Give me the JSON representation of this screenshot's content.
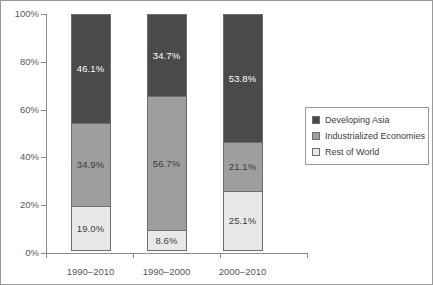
{
  "chart_data": {
    "type": "bar",
    "stacked": true,
    "title": "",
    "subtitle": "",
    "xlabel": "",
    "ylabel": "",
    "categories": [
      "1990–2010",
      "1990–2000",
      "2000–2010"
    ],
    "series": [
      {
        "name": "Developing Asia",
        "color": "#4a4a4a",
        "values": [
          46.1,
          34.7,
          53.8
        ],
        "labels": [
          "46.1%",
          "34.7%",
          "53.8%"
        ],
        "label_color": "on-dark"
      },
      {
        "name": "Industrialized Economies",
        "color": "#9e9e9e",
        "values": [
          34.9,
          56.7,
          21.1
        ],
        "labels": [
          "34.9%",
          "56.7%",
          "21.1%"
        ],
        "label_color": "on-light"
      },
      {
        "name": "Rest of World",
        "color": "#e8e8e8",
        "values": [
          19.0,
          8.6,
          25.1
        ],
        "labels": [
          "19.0%",
          "8.6%",
          "25.1%"
        ],
        "label_color": "on-light"
      }
    ],
    "ylim": [
      0,
      100
    ],
    "yticks": [
      0,
      20,
      40,
      60,
      80,
      100
    ],
    "ytick_labels": [
      "0%",
      "20%",
      "40%",
      "60%",
      "80%",
      "100%"
    ],
    "grid": false,
    "legend_position": "right",
    "legend_entries": [
      "Developing Asia",
      "Industrialized Economies",
      "Rest of World"
    ]
  },
  "axes": {
    "y": {
      "ticks": [
        {
          "value": 100,
          "label": "100%"
        },
        {
          "value": 80,
          "label": "80%"
        },
        {
          "value": 60,
          "label": "60%"
        },
        {
          "value": 40,
          "label": "40%"
        },
        {
          "value": 20,
          "label": "20%"
        },
        {
          "value": 0,
          "label": "0%"
        }
      ]
    },
    "x": {
      "ticks": [
        {
          "label": "1990–2010"
        },
        {
          "label": "1990–2000"
        },
        {
          "label": "2000–2010"
        }
      ]
    }
  },
  "bars": [
    {
      "category": "1990–2010",
      "segments": [
        {
          "series": "Developing Asia",
          "value": 46.1,
          "label": "46.1%",
          "color": "#4a4a4a",
          "label_class": "on-dark"
        },
        {
          "series": "Industrialized Economies",
          "value": 34.9,
          "label": "34.9%",
          "color": "#9e9e9e",
          "label_class": "on-light"
        },
        {
          "series": "Rest of World",
          "value": 19.0,
          "label": "19.0%",
          "color": "#e8e8e8",
          "label_class": "on-light"
        }
      ]
    },
    {
      "category": "1990–2000",
      "segments": [
        {
          "series": "Developing Asia",
          "value": 34.7,
          "label": "34.7%",
          "color": "#4a4a4a",
          "label_class": "on-dark"
        },
        {
          "series": "Industrialized Economies",
          "value": 56.7,
          "label": "56.7%",
          "color": "#9e9e9e",
          "label_class": "on-light"
        },
        {
          "series": "Rest of World",
          "value": 8.6,
          "label": "8.6%",
          "color": "#e8e8e8",
          "label_class": "on-light"
        }
      ]
    },
    {
      "category": "2000–2010",
      "segments": [
        {
          "series": "Developing Asia",
          "value": 53.8,
          "label": "53.8%",
          "color": "#4a4a4a",
          "label_class": "on-dark"
        },
        {
          "series": "Industrialized Economies",
          "value": 21.1,
          "label": "21.1%",
          "color": "#9e9e9e",
          "label_class": "on-light"
        },
        {
          "series": "Rest of World",
          "value": 25.1,
          "label": "25.1%",
          "color": "#e8e8e8",
          "label_class": "on-light"
        }
      ]
    }
  ],
  "legend": {
    "items": [
      {
        "label": "Developing Asia",
        "color": "#4a4a4a"
      },
      {
        "label": "Industrialized Economies",
        "color": "#9e9e9e"
      },
      {
        "label": "Rest of World",
        "color": "#e8e8e8"
      }
    ]
  },
  "colors": {
    "developing_asia": "#4a4a4a",
    "industrialized_economies": "#9e9e9e",
    "rest_of_world": "#e8e8e8",
    "axis": "#8c8c8c",
    "frame": "#9a9a9a",
    "tick_text": "#58585a"
  }
}
